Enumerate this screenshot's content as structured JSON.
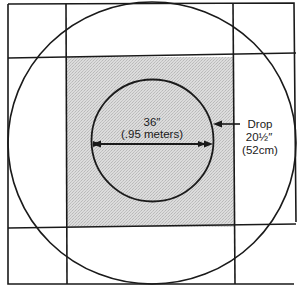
{
  "diagram": {
    "colors": {
      "line": "#1a1a1a",
      "shaded_fill": "#d4d4d4",
      "background": "#ffffff"
    },
    "table": {
      "diameter_label": "36″",
      "diameter_metric_label": "(.95 meters)"
    },
    "drop": {
      "label": "Drop",
      "value_label": "20½″",
      "metric_label": "(52cm)"
    }
  }
}
